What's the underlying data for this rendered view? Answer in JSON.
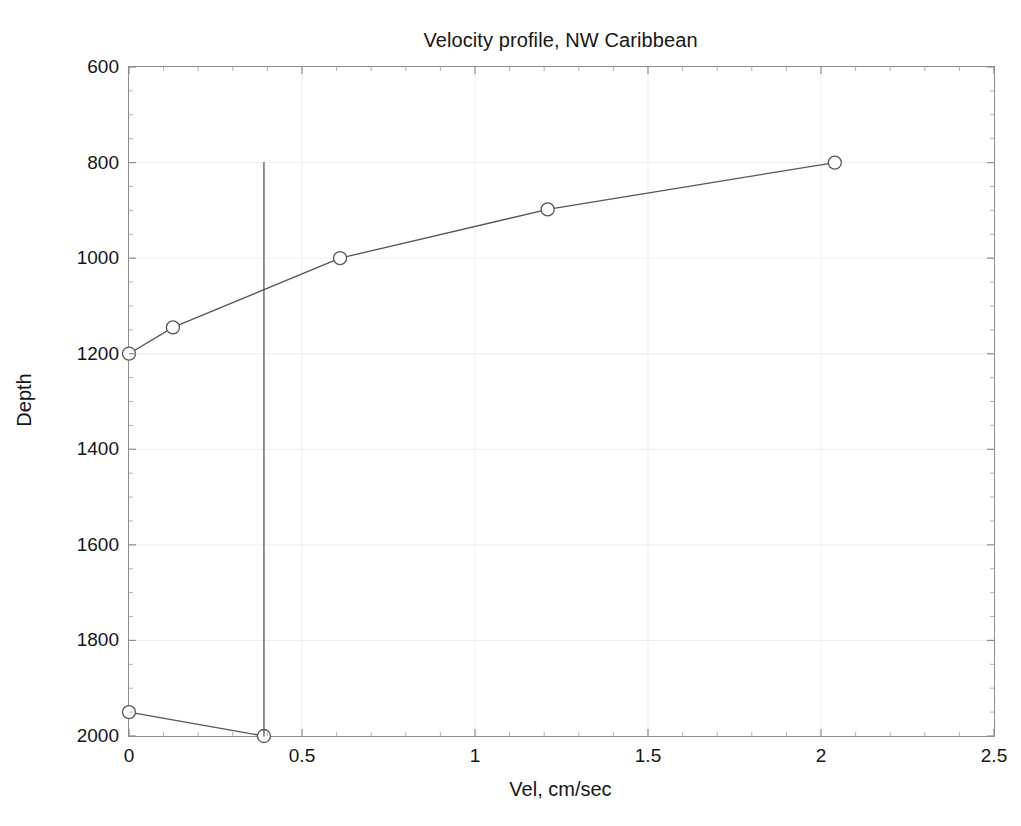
{
  "chart_data": {
    "type": "line",
    "title": "Velocity profile, NW Caribbean",
    "xlabel": "Vel, cm/sec",
    "ylabel": "Depth",
    "xlim": [
      0,
      2.5
    ],
    "ylim": [
      600,
      2000
    ],
    "y_inverted": true,
    "grid": true,
    "legend": null,
    "xticks": [
      "0",
      "0.5",
      "1",
      "1.5",
      "2",
      "2.5"
    ],
    "xtick_values": [
      0,
      0.5,
      1,
      1.5,
      2,
      2.5
    ],
    "yticks": [
      "600",
      "800",
      "1000",
      "1200",
      "1400",
      "1600",
      "1800",
      "2000"
    ],
    "ytick_values": [
      600,
      800,
      1000,
      1200,
      1400,
      1600,
      1800,
      2000
    ],
    "series": [
      {
        "name": "velocity profile",
        "marker": "circle-open",
        "line_color": "#555555",
        "marker_color": "#555555",
        "x": [
          0,
          0.127,
          0.61,
          1.21,
          2.04
        ],
        "y": [
          1200,
          1145,
          1000,
          898,
          800
        ]
      },
      {
        "name": "deep segment",
        "marker": "circle-open",
        "line_color": "#555555",
        "marker_color": "#555555",
        "x": [
          0,
          0.39
        ],
        "y": [
          1950,
          2000
        ]
      },
      {
        "name": "reference vertical",
        "marker": "none",
        "line_color": "#555555",
        "marker_color": "#555555",
        "x": [
          0.39,
          0.39
        ],
        "y": [
          800,
          2000
        ]
      }
    ]
  }
}
